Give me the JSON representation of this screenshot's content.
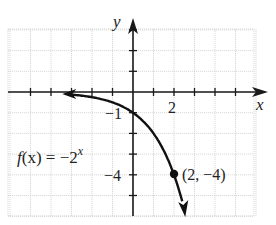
{
  "chart_data": {
    "type": "line",
    "title": "",
    "xlabel": "x",
    "ylabel": "y",
    "function_label": "f(x) = −2^x",
    "function_label_parts": {
      "lhs": "f(x) = −2",
      "exponent": "x"
    },
    "xlim": [
      -6,
      6
    ],
    "ylim": [
      -6,
      4
    ],
    "grid": true,
    "x_tick_labels": [
      {
        "value": 2,
        "label": "2"
      }
    ],
    "y_tick_labels": [
      {
        "value": -1,
        "label": "−1"
      },
      {
        "value": -4,
        "label": "−4"
      }
    ],
    "series": [
      {
        "name": "f(x) = -2^x",
        "x": [
          -3,
          -2,
          -1,
          0,
          1,
          2,
          2.5
        ],
        "y": [
          -0.125,
          -0.25,
          -0.5,
          -1,
          -2,
          -4,
          -5.66
        ]
      }
    ],
    "annotations": [
      {
        "point": [
          2,
          -4
        ],
        "label": "(2, −4)",
        "marker": "filled-circle"
      }
    ],
    "asymptote": {
      "type": "horizontal",
      "y": 0
    }
  },
  "labels": {
    "x_axis": "x",
    "y_axis": "y",
    "x_tick_2": "2",
    "y_tick_neg1": "−1",
    "y_tick_neg4": "−4",
    "func_lhs": "f(x) = −2",
    "func_exp": "x",
    "point": "(2, −4)"
  },
  "colors": {
    "curve": "#111111",
    "axis": "#1a1a1a",
    "grid": "#cfcfcf",
    "background": "#ffffff"
  }
}
